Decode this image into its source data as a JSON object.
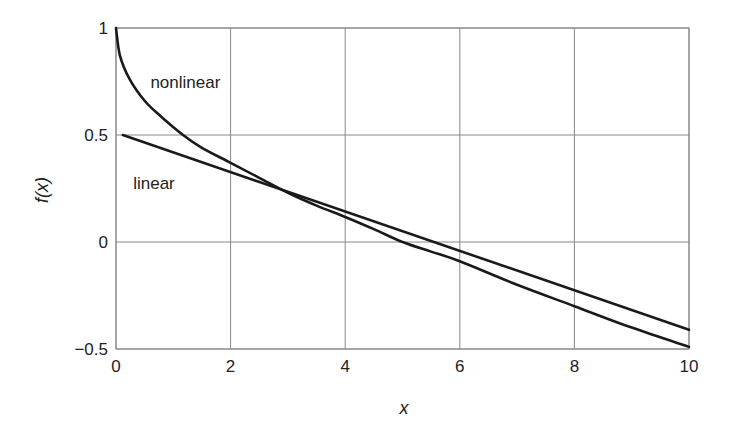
{
  "chart_data": {
    "type": "line",
    "title": "",
    "xlabel": "x",
    "ylabel": "f(x)",
    "xlim": [
      0,
      10
    ],
    "ylim": [
      -0.5,
      1
    ],
    "grid": true,
    "legend": "none (inline annotations)",
    "xticks": [
      0,
      2,
      4,
      6,
      8,
      10
    ],
    "xtick_labels": [
      "0",
      "2",
      "4",
      "6",
      "8",
      "10"
    ],
    "yticks": [
      -0.5,
      0,
      0.5,
      1
    ],
    "ytick_labels": [
      "−0.5",
      "0",
      "0.5",
      "1"
    ],
    "annotations": [
      {
        "text": "nonlinear",
        "x": 0.6,
        "y": 0.72
      },
      {
        "text": "linear",
        "x": 0.3,
        "y": 0.25
      }
    ],
    "series": [
      {
        "name": "nonlinear",
        "color": "#1a1a1a",
        "points": [
          [
            0,
            1.0
          ],
          [
            0.07,
            0.87
          ],
          [
            0.24,
            0.76
          ],
          [
            0.5,
            0.66
          ],
          [
            0.77,
            0.59
          ],
          [
            1.17,
            0.5
          ],
          [
            1.5,
            0.44
          ],
          [
            2,
            0.37
          ],
          [
            2.5,
            0.3
          ],
          [
            3,
            0.23
          ],
          [
            3.5,
            0.17
          ],
          [
            4,
            0.117
          ],
          [
            4.5,
            0.06
          ],
          [
            5,
            0.0
          ],
          [
            5.5,
            -0.045
          ],
          [
            6,
            -0.09
          ],
          [
            7,
            -0.2
          ],
          [
            8,
            -0.3
          ],
          [
            9,
            -0.4
          ],
          [
            10,
            -0.49
          ]
        ]
      },
      {
        "name": "linear",
        "color": "#1a1a1a",
        "points": [
          [
            0.12,
            0.5
          ],
          [
            10,
            -0.41
          ]
        ]
      }
    ]
  }
}
